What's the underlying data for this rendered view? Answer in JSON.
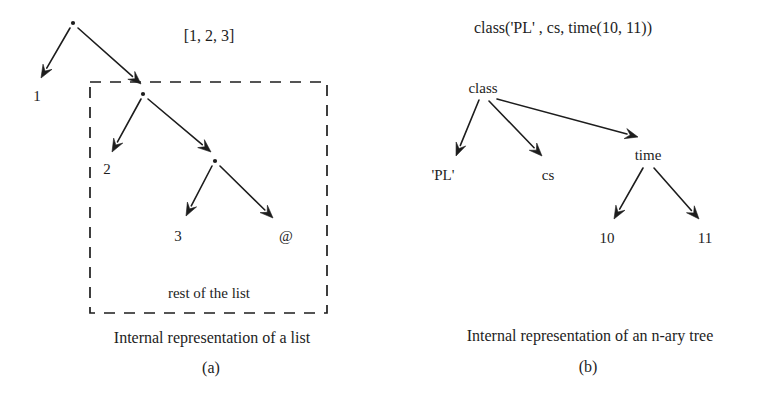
{
  "figure": {
    "title_semantic": "internal-representation-of-list-and-n-ary-tree",
    "background_color": "#ffffff",
    "ink_color": "#1d1d1d",
    "width": 764,
    "height": 398
  },
  "panel_a": {
    "expression": "[1, 2, 3]",
    "caption": "Internal representation of a list",
    "caption_tag": "(a)",
    "box_note": "rest of the list",
    "nodes": [
      {
        "id": "cons0",
        "kind": "cons-dot",
        "label": "",
        "x": 73,
        "y": 23
      },
      {
        "id": "leaf1",
        "kind": "leaf",
        "label": "1",
        "x": 37,
        "y": 101
      },
      {
        "id": "cons1",
        "kind": "cons-dot",
        "label": "",
        "x": 143,
        "y": 94
      },
      {
        "id": "leaf2",
        "kind": "leaf",
        "label": "2",
        "x": 107,
        "y": 174
      },
      {
        "id": "cons2",
        "kind": "cons-dot",
        "label": "",
        "x": 215,
        "y": 161
      },
      {
        "id": "leaf3",
        "kind": "leaf",
        "label": "3",
        "x": 178,
        "y": 241
      },
      {
        "id": "leafnil",
        "kind": "leaf",
        "label": "@",
        "x": 286,
        "y": 241
      }
    ],
    "edges": [
      {
        "from": "cons0",
        "to": "leaf1",
        "x1": 70,
        "y1": 28,
        "x2": 41,
        "y2": 78
      },
      {
        "from": "cons0",
        "to": "cons1",
        "x1": 78,
        "y1": 28,
        "x2": 141,
        "y2": 84
      },
      {
        "from": "cons1",
        "to": "leaf2",
        "x1": 141,
        "y1": 99,
        "x2": 112,
        "y2": 152
      },
      {
        "from": "cons1",
        "to": "cons2",
        "x1": 148,
        "y1": 99,
        "x2": 211,
        "y2": 152
      },
      {
        "from": "cons2",
        "to": "leaf3",
        "x1": 212,
        "y1": 166,
        "x2": 186,
        "y2": 216
      },
      {
        "from": "cons2",
        "to": "leafnil",
        "x1": 220,
        "y1": 166,
        "x2": 273,
        "y2": 218
      }
    ],
    "dashed_box": {
      "x": 90,
      "y": 82,
      "width": 237,
      "height": 231
    }
  },
  "panel_b": {
    "expression": "class('PL' , cs, time(10, 11))",
    "caption": "Internal representation of an n-ary tree",
    "caption_tag": "(b)",
    "nodes": [
      {
        "id": "class",
        "kind": "label",
        "label": "class",
        "x": 483,
        "y": 93
      },
      {
        "id": "pl",
        "kind": "label",
        "label": "'PL'",
        "x": 443,
        "y": 180
      },
      {
        "id": "cs",
        "kind": "label",
        "label": "cs",
        "x": 548,
        "y": 180
      },
      {
        "id": "time",
        "kind": "label",
        "label": "time",
        "x": 648,
        "y": 160
      },
      {
        "id": "ten",
        "kind": "label",
        "label": "10",
        "x": 607,
        "y": 243
      },
      {
        "id": "eleven",
        "kind": "label",
        "label": "11",
        "x": 705,
        "y": 243
      }
    ],
    "edges": [
      {
        "from": "class",
        "to": "pl",
        "x1": 479,
        "y1": 100,
        "x2": 456,
        "y2": 156
      },
      {
        "from": "class",
        "to": "cs",
        "x1": 489,
        "y1": 101,
        "x2": 542,
        "y2": 156
      },
      {
        "from": "class",
        "to": "time",
        "x1": 497,
        "y1": 99,
        "x2": 638,
        "y2": 137
      },
      {
        "from": "time",
        "to": "ten",
        "x1": 643,
        "y1": 168,
        "x2": 614,
        "y2": 219
      },
      {
        "from": "time",
        "to": "eleven",
        "x1": 654,
        "y1": 168,
        "x2": 699,
        "y2": 219
      }
    ]
  }
}
